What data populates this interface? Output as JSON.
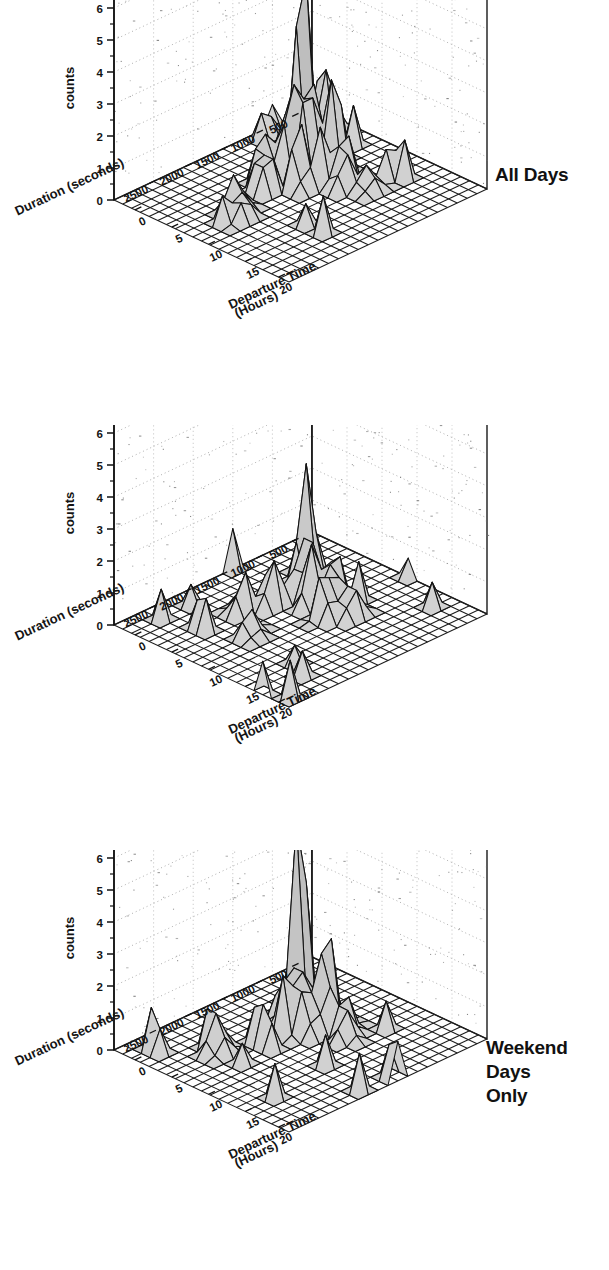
{
  "figure": {
    "background": "#ffffff",
    "panel_count": 3,
    "surface_fill": "#d9d9d9",
    "line_color": "#101010"
  },
  "panels": [
    {
      "id": "all-days",
      "title": "All Days",
      "title_lines": [
        "All Days"
      ],
      "zlabel": "counts",
      "xlabel_line1": "Duration (seconds)",
      "ylabel_line1": "Departure Time",
      "ylabel_line2": "(Hours)",
      "z_ticks": [
        "0",
        "1",
        "2",
        "3",
        "4",
        "5",
        "6",
        "7"
      ],
      "x_ticks": [
        "500",
        "1000",
        "1500",
        "2000",
        "2500"
      ],
      "y_ticks": [
        "0",
        "5",
        "10",
        "15",
        "20"
      ]
    },
    {
      "id": "weekend-days-only",
      "title": "Weekend Days Only",
      "title_lines": [
        "Weekend",
        "Days",
        "Only"
      ],
      "zlabel": "counts",
      "xlabel_line1": "Duration (seconds)",
      "ylabel_line1": "Departure Time",
      "ylabel_line2": "(Hours)",
      "z_ticks": [
        "0",
        "1",
        "2",
        "3",
        "4",
        "5",
        "6",
        "7"
      ],
      "x_ticks": [
        "500",
        "1000",
        "1500",
        "2000",
        "2500"
      ],
      "y_ticks": [
        "0",
        "5",
        "10",
        "15",
        "20"
      ]
    },
    {
      "id": "week-days-only",
      "title": "Week Days Only",
      "title_lines": [
        "Week",
        "Days",
        "Only"
      ],
      "zlabel": "counts",
      "xlabel_line1": "Duration (seconds)",
      "ylabel_line1": "Departure Time",
      "ylabel_line2": "(Hours)",
      "z_ticks": [
        "0",
        "1",
        "2",
        "3",
        "4",
        "5",
        "6",
        "7"
      ],
      "x_ticks": [
        "500",
        "1000",
        "1500",
        "2000",
        "2500"
      ],
      "y_ticks": [
        "0",
        "5",
        "10",
        "15",
        "20"
      ]
    }
  ],
  "chart_data": [
    {
      "type": "heatmap",
      "render": "3d-surface-mesh",
      "title": "All Days",
      "xlabel": "Departure Time (Hours)",
      "ylabel": "Duration (seconds)",
      "zlabel": "counts",
      "xlim": [
        0,
        24
      ],
      "ylim": [
        0,
        2800
      ],
      "zlim": [
        0,
        7
      ],
      "x_tick_values": [
        0,
        5,
        10,
        15,
        20
      ],
      "y_tick_values": [
        500,
        1000,
        1500,
        2000,
        2500
      ],
      "z_tick_values": [
        0,
        1,
        2,
        3,
        4,
        5,
        6,
        7
      ],
      "grid": true,
      "legend": "none",
      "x_bins": 20,
      "y_bins": 20,
      "peaks": [
        {
          "departure_hour": 6.0,
          "duration_s": 750,
          "counts": 7
        },
        {
          "departure_hour": 5.5,
          "duration_s": 400,
          "counts": 3.5
        },
        {
          "departure_hour": 8.0,
          "duration_s": 1150,
          "counts": 4
        },
        {
          "departure_hour": 8.5,
          "duration_s": 900,
          "counts": 3.5
        },
        {
          "departure_hour": 9.5,
          "duration_s": 1050,
          "counts": 3.5
        },
        {
          "departure_hour": 10.5,
          "duration_s": 800,
          "counts": 4
        },
        {
          "departure_hour": 11.0,
          "duration_s": 1300,
          "counts": 2.5
        },
        {
          "departure_hour": 7.5,
          "duration_s": 1450,
          "counts": 2
        },
        {
          "departure_hour": 9.0,
          "duration_s": 1600,
          "counts": 2
        },
        {
          "departure_hour": 12.0,
          "duration_s": 1100,
          "counts": 2
        },
        {
          "departure_hour": 13.0,
          "duration_s": 900,
          "counts": 2
        },
        {
          "departure_hour": 14.0,
          "duration_s": 1000,
          "counts": 1.5
        },
        {
          "departure_hour": 16.0,
          "duration_s": 850,
          "counts": 1
        },
        {
          "departure_hour": 10.0,
          "duration_s": 2100,
          "counts": 1.5
        },
        {
          "departure_hour": 11.5,
          "duration_s": 2200,
          "counts": 1
        }
      ]
    },
    {
      "type": "heatmap",
      "render": "3d-surface-mesh",
      "title": "Weekend Days Only",
      "xlabel": "Departure Time (Hours)",
      "ylabel": "Duration (seconds)",
      "zlabel": "counts",
      "xlim": [
        0,
        24
      ],
      "ylim": [
        0,
        2800
      ],
      "zlim": [
        0,
        7
      ],
      "x_tick_values": [
        0,
        5,
        10,
        15,
        20
      ],
      "y_tick_values": [
        500,
        1000,
        1500,
        2000,
        2500
      ],
      "z_tick_values": [
        0,
        1,
        2,
        3,
        4,
        5,
        6,
        7
      ],
      "grid": true,
      "legend": "none",
      "x_bins": 20,
      "y_bins": 20,
      "peaks": [
        {
          "departure_hour": 6.0,
          "duration_s": 700,
          "counts": 3.5
        },
        {
          "departure_hour": 9.0,
          "duration_s": 1000,
          "counts": 3
        },
        {
          "departure_hour": 10.5,
          "duration_s": 1100,
          "counts": 2.5
        },
        {
          "departure_hour": 11.5,
          "duration_s": 900,
          "counts": 2.5
        },
        {
          "departure_hour": 12.5,
          "duration_s": 1000,
          "counts": 2
        },
        {
          "departure_hour": 8.0,
          "duration_s": 1400,
          "counts": 2
        },
        {
          "departure_hour": 13.5,
          "duration_s": 1200,
          "counts": 2
        },
        {
          "departure_hour": 15.0,
          "duration_s": 1000,
          "counts": 1.5
        },
        {
          "departure_hour": 7.0,
          "duration_s": 1700,
          "counts": 1.5
        },
        {
          "departure_hour": 11.0,
          "duration_s": 2000,
          "counts": 1
        }
      ]
    },
    {
      "type": "heatmap",
      "render": "3d-surface-mesh",
      "title": "Week Days Only",
      "xlabel": "Departure Time (Hours)",
      "ylabel": "Duration (seconds)",
      "zlabel": "counts",
      "xlim": [
        0,
        24
      ],
      "ylim": [
        0,
        2800
      ],
      "zlim": [
        0,
        7
      ],
      "x_tick_values": [
        0,
        5,
        10,
        15,
        20
      ],
      "y_tick_values": [
        500,
        1000,
        1500,
        2000,
        2500
      ],
      "z_tick_values": [
        0,
        1,
        2,
        3,
        4,
        5,
        6,
        7
      ],
      "grid": true,
      "legend": "none",
      "x_bins": 20,
      "y_bins": 20,
      "peaks": [
        {
          "departure_hour": 6.0,
          "duration_s": 800,
          "counts": 7
        },
        {
          "departure_hour": 10.5,
          "duration_s": 900,
          "counts": 4
        },
        {
          "departure_hour": 9.0,
          "duration_s": 1100,
          "counts": 3
        },
        {
          "departure_hour": 9.5,
          "duration_s": 1350,
          "counts": 2.5
        },
        {
          "departure_hour": 8.0,
          "duration_s": 1250,
          "counts": 2
        },
        {
          "departure_hour": 11.0,
          "duration_s": 1200,
          "counts": 2
        },
        {
          "departure_hour": 12.0,
          "duration_s": 1000,
          "counts": 1.5
        },
        {
          "departure_hour": 13.0,
          "duration_s": 900,
          "counts": 1.5
        },
        {
          "departure_hour": 7.5,
          "duration_s": 2100,
          "counts": 1.5
        },
        {
          "departure_hour": 14.5,
          "duration_s": 1000,
          "counts": 1
        }
      ]
    }
  ]
}
